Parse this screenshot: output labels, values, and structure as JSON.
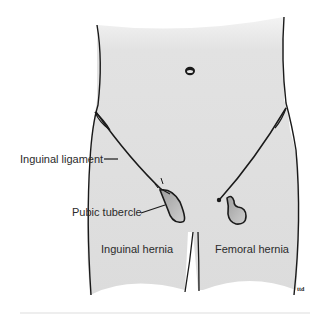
{
  "figure": {
    "colors": {
      "body_fill": "#e3e3e3",
      "outline": "#1a1a1a",
      "hernia_fill": "#b8b8b8",
      "background": "#ffffff",
      "label_text": "#2b2b2b"
    }
  },
  "labels": {
    "inguinal_ligament": "Inguinal ligament",
    "pubic_tubercle": "Pubic tubercle",
    "inguinal_hernia": "Inguinal hernia",
    "femoral_hernia": "Femoral hernia"
  },
  "signature": "ttd"
}
